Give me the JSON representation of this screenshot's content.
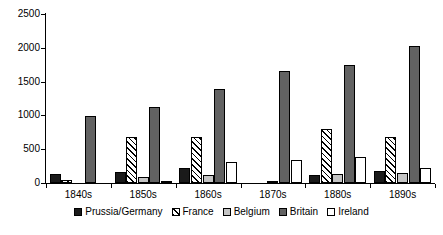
{
  "chart_data": {
    "type": "bar",
    "title": "",
    "subtitle": "",
    "xlabel": "",
    "ylabel": "",
    "categories": [
      "1840s",
      "1850s",
      "1860s",
      "1870s",
      "1880s",
      "1890s"
    ],
    "series": [
      {
        "name": "Prussia/Germany",
        "color": "#1a1a1a",
        "pattern": "solid-black",
        "values": [
          140,
          160,
          215,
          null,
          115,
          180
        ]
      },
      {
        "name": "France",
        "color": "#ffffff",
        "pattern": "diagonal-hatch",
        "values": [
          50,
          680,
          680,
          null,
          800,
          675
        ]
      },
      {
        "name": "Belgium",
        "color": "#c4c4c4",
        "pattern": "light-gray",
        "values": [
          null,
          85,
          120,
          20,
          140,
          150
        ]
      },
      {
        "name": "Britain",
        "color": "#626262",
        "pattern": "dark-gray",
        "values": [
          990,
          1120,
          1390,
          1660,
          1745,
          2025
        ]
      },
      {
        "name": "Ireland",
        "color": "#ffffff",
        "pattern": "white-outline",
        "values": [
          null,
          10,
          310,
          340,
          380,
          215
        ]
      }
    ],
    "ylim": [
      0,
      2500
    ],
    "yticks": [
      0,
      500,
      1000,
      1500,
      2000,
      2500
    ],
    "ytick_labels": [
      "0",
      "500",
      "1000",
      "1500",
      "2000",
      "2500"
    ],
    "grid": false,
    "legend_position": "bottom"
  },
  "legend": {
    "items": [
      {
        "label": "Prussia/Germany"
      },
      {
        "label": "France"
      },
      {
        "label": "Belgium"
      },
      {
        "label": "Britain"
      },
      {
        "label": "Ireland"
      }
    ]
  }
}
